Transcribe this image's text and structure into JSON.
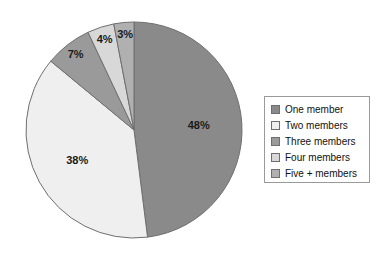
{
  "chart_data": {
    "type": "pie",
    "title": "",
    "categories": [
      "One member",
      "Two members",
      "Three members",
      "Four members",
      "Five + members"
    ],
    "values": [
      48,
      38,
      7,
      4,
      3
    ],
    "value_labels": [
      "48%",
      "38%",
      "7%",
      "4%",
      "3%"
    ],
    "unit": "%",
    "colors": [
      "#8a8a8a",
      "#efefef",
      "#9a9a9a",
      "#d8d8d8",
      "#b0b0b0"
    ],
    "slice_border_color": "#6f6f6f",
    "start_angle_deg": 0,
    "direction": "clockwise",
    "legend": {
      "position": "right",
      "border_color": "#9a9a9a",
      "background": "#ffffff",
      "entries": [
        {
          "label": "One member",
          "color": "#8a8a8a"
        },
        {
          "label": "Two members",
          "color": "#efefef"
        },
        {
          "label": "Three members",
          "color": "#9a9a9a"
        },
        {
          "label": "Four members",
          "color": "#d8d8d8"
        },
        {
          "label": "Five + members",
          "color": "#b0b0b0"
        }
      ]
    },
    "geometry": {
      "center_x": 134,
      "center_y": 130,
      "radius": 108
    },
    "grid": false,
    "xlabel": "",
    "ylabel": ""
  }
}
